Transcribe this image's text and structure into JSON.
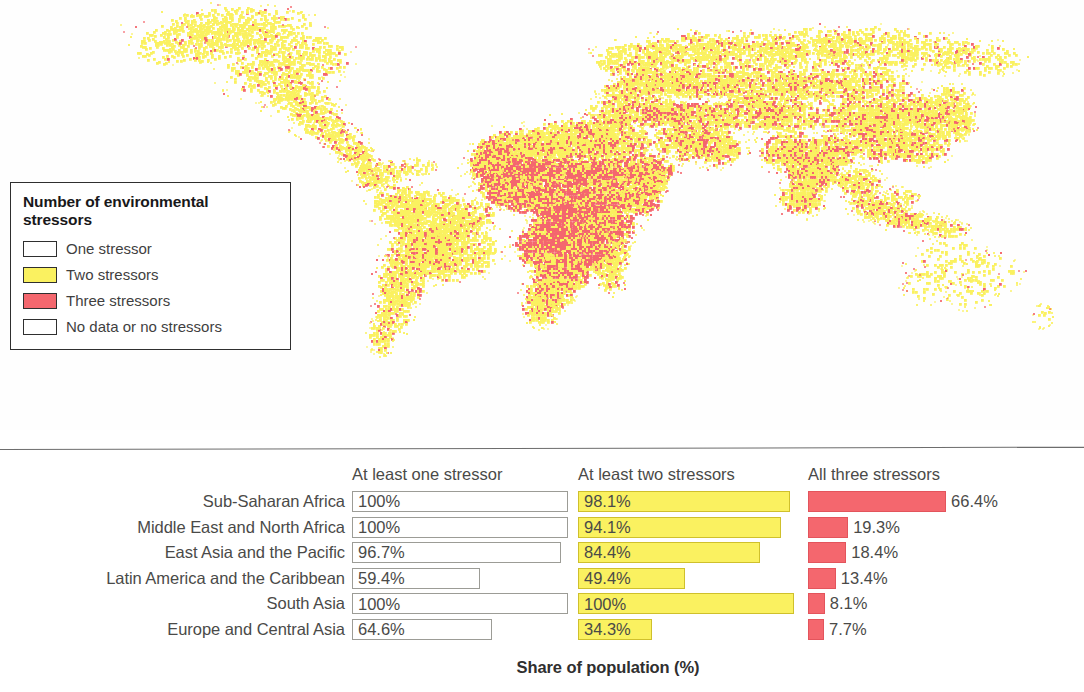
{
  "map": {
    "name": "world-population-environmental-stressors-map",
    "projection_note": "global raster grid",
    "colors": {
      "one_stressor": "#ffffff",
      "two_stressors": "#faf160",
      "three_stressors": "#f4676e",
      "no_data": "#ffffff",
      "outline": "#2f2f2f"
    }
  },
  "legend": {
    "title": "Number of environmental stressors",
    "items": [
      {
        "label": "One stressor",
        "color": "#ffffff"
      },
      {
        "label": "Two stressors",
        "color": "#faf160"
      },
      {
        "label": "Three stressors",
        "color": "#f4676e"
      },
      {
        "label": "No data or no stressors",
        "color": "#ffffff"
      }
    ]
  },
  "chart_data": {
    "type": "bar",
    "title": "",
    "subtitle": "",
    "orientation": "horizontal",
    "xlabel": "Share of population (%)",
    "ylabel": "",
    "xlim": [
      0,
      100
    ],
    "grid": false,
    "legend_position": "none",
    "categories": [
      "Sub-Saharan Africa",
      "Middle East and North Africa",
      "East Asia and the Pacific",
      "Latin America and the Caribbean",
      "South Asia",
      "Europe and Central Asia"
    ],
    "series": [
      {
        "name": "At least one stressor",
        "color": "#ffffff",
        "border": "#9c9c96",
        "values": [
          100,
          100,
          96.7,
          59.4,
          100,
          64.6
        ],
        "labels": [
          "100%",
          "100%",
          "96.7%",
          "59.4%",
          "100%",
          "64.6%"
        ],
        "label_placement": "inside"
      },
      {
        "name": "At least two stressors",
        "color": "#faf160",
        "border": "#cfc02c",
        "values": [
          98.1,
          94.1,
          84.4,
          49.4,
          100,
          34.3
        ],
        "labels": [
          "98.1%",
          "94.1%",
          "84.4%",
          "49.4%",
          "100%",
          "34.3%"
        ],
        "label_placement": "inside"
      },
      {
        "name": "All three stressors",
        "color": "#f4676e",
        "border": "#e3545c",
        "values": [
          66.4,
          19.3,
          18.4,
          13.4,
          8.1,
          7.7
        ],
        "labels": [
          "66.4%",
          "19.3%",
          "18.4%",
          "13.4%",
          "8.1%",
          "7.7%"
        ],
        "label_placement": "outside"
      }
    ]
  }
}
